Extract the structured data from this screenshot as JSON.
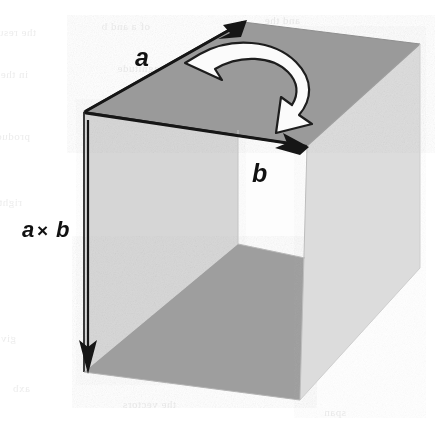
{
  "figure": {
    "background_color": "#ffffff"
  },
  "labels": {
    "vector_a": "a",
    "vector_b": "b",
    "cross_product_operand_left": "a",
    "cross_product_operator": "×",
    "cross_product_operand_right": "b"
  },
  "colors": {
    "top_face": "#9a9a9a",
    "inner_floor": "#9e9e9e",
    "front_face": "#d8d8d8",
    "right_face": "#dcdcdc",
    "inner_left_face": "#d2d2d2",
    "opening": "#fdfdfd",
    "edge_line": "#2a2a2a",
    "arrow_fill": "#161616",
    "rotation_arrow_fill": "#fbfbfb",
    "rotation_arrow_stroke": "#1d1d1d",
    "ghost_text": "#ededed"
  },
  "geometry": {
    "front_top_left": [
      84,
      112
    ],
    "top_back_left": [
      243,
      22
    ],
    "top_back_right": [
      420,
      44
    ],
    "front_top_right": [
      307,
      146
    ],
    "front_bottom_left": [
      84,
      372
    ],
    "front_bottom_right": [
      300,
      400
    ],
    "right_bottom_back": [
      420,
      268
    ],
    "opening_top_left": [
      238,
      130
    ],
    "opening_bottom_right": [
      305,
      258
    ]
  },
  "arrows": {
    "vector_a": {
      "from": [
        84,
        112
      ],
      "to": [
        243,
        22
      ],
      "name": "vector-a-arrow",
      "direction": "up-right"
    },
    "vector_b": {
      "from": [
        84,
        112
      ],
      "to": [
        307,
        146
      ],
      "name": "vector-b-arrow",
      "direction": "down-right"
    },
    "cross_product": {
      "from": [
        88,
        120
      ],
      "to": [
        88,
        372
      ],
      "name": "cross-product-arrow",
      "direction": "down"
    },
    "rotation": {
      "name": "rotation-arrow",
      "direction": "clockwise",
      "from_vector": "a",
      "to_vector": "b"
    }
  },
  "ghost_lines": [
    {
      "text": "the resulting",
      "x": 36,
      "y": 36,
      "size": 11
    },
    {
      "text": "of a and b",
      "x": 150,
      "y": 30,
      "size": 11
    },
    {
      "text": "and the",
      "x": 300,
      "y": 24,
      "size": 11
    },
    {
      "text": "in the direction",
      "x": 28,
      "y": 78,
      "size": 11
    },
    {
      "text": "magnitude",
      "x": 168,
      "y": 72,
      "size": 11
    },
    {
      "text": "vector",
      "x": 330,
      "y": 86,
      "size": 11
    },
    {
      "text": "product of",
      "x": 30,
      "y": 140,
      "size": 11
    },
    {
      "text": "perpendicular",
      "x": 180,
      "y": 150,
      "size": 11
    },
    {
      "text": "plane",
      "x": 352,
      "y": 160,
      "size": 11
    },
    {
      "text": "right",
      "x": 22,
      "y": 206,
      "size": 11
    },
    {
      "text": "operation",
      "x": 196,
      "y": 216,
      "size": 11
    },
    {
      "text": "rule",
      "x": 356,
      "y": 228,
      "size": 11
    },
    {
      "text": "the area",
      "x": 184,
      "y": 286,
      "size": 11
    },
    {
      "text": "equals",
      "x": 344,
      "y": 300,
      "size": 11
    },
    {
      "text": "given by",
      "x": 16,
      "y": 342,
      "size": 11
    },
    {
      "text": "parallelogram",
      "x": 212,
      "y": 350,
      "size": 11
    },
    {
      "text": "axb",
      "x": 30,
      "y": 392,
      "size": 12
    },
    {
      "text": "the vectors",
      "x": 176,
      "y": 408,
      "size": 11
    },
    {
      "text": "span",
      "x": 346,
      "y": 416,
      "size": 11
    }
  ]
}
